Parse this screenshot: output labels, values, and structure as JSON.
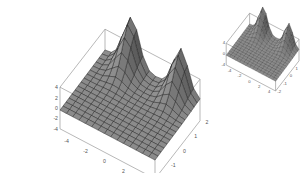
{
  "chart_data": [
    {
      "type": "surface3d",
      "title": "",
      "description": "3D surface plot with two peaks at the back edge and a flat plane at the front, drawn with a mesh grid",
      "x_ticks": [
        "-4",
        "-2",
        "0",
        "2",
        "4"
      ],
      "y_ticks": [
        "-2",
        "-1",
        "0",
        "1",
        "2"
      ],
      "z_ticks": [
        "4",
        "2",
        "0",
        "-2",
        "-4"
      ],
      "xlim": [
        -5,
        5
      ],
      "ylim": [
        -2,
        2
      ],
      "zlim": [
        -4,
        4
      ],
      "mesh": "15x15",
      "surface_color": "#8a8a8a",
      "mesh_color": "#222222",
      "box_color": "#888888"
    },
    {
      "type": "surface3d",
      "title": "",
      "description": "Smaller copy of the same 3D surface plot, top-right",
      "x_ticks": [
        "-4",
        "-2",
        "0",
        "2",
        "4"
      ],
      "y_ticks": [
        "-2",
        "-1",
        "0",
        "1",
        "2"
      ],
      "z_ticks": [
        "4",
        "0",
        "-4"
      ],
      "xlim": [
        -5,
        5
      ],
      "ylim": [
        -2,
        2
      ],
      "zlim": [
        -4,
        4
      ]
    }
  ],
  "plots": [
    {
      "x": 0,
      "y": 0,
      "s": 1.0,
      "font": 5.2
    },
    {
      "x": 195,
      "y": -2,
      "s": 0.52,
      "font": 4.2
    }
  ]
}
